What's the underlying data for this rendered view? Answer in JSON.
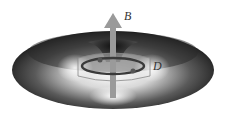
{
  "diagram": {
    "labels": {
      "field_arrow": "B",
      "ring": "D"
    },
    "colors": {
      "torus_dark": "#1e1e1e",
      "torus_mid": "#6a6a6a",
      "torus_light": "#f2f2f2",
      "arrow": "#9a9a9a",
      "ring": "#3a3a3a",
      "background": "#ffffff"
    }
  }
}
